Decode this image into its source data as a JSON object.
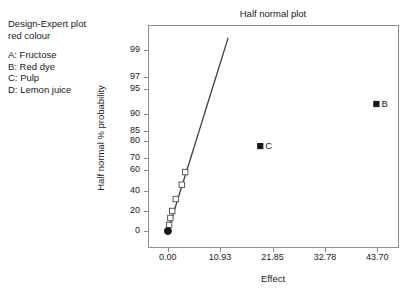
{
  "annotation": {
    "title_lines": [
      "Design-Expert plot",
      "red colour"
    ],
    "factors": [
      "A: Fructose",
      "B: Red dye",
      "C: Pulp",
      "D: Lemon juice"
    ]
  },
  "chart_data": {
    "type": "scatter",
    "title": "Half normal plot",
    "xlabel": "Effect",
    "ylabel": "Half normal % probability",
    "xlim": [
      -4.1,
      48.0
    ],
    "ylim": [
      0,
      99
    ],
    "grid": false,
    "legend": "none",
    "xticks": [
      "0.00",
      "10.93",
      "21.85",
      "32.78",
      "43.70"
    ],
    "xtick_values": [
      0.0,
      10.93,
      21.85,
      32.78,
      43.7
    ],
    "yticks": [
      "99",
      "97",
      "95",
      "90",
      "85",
      "80",
      "70",
      "60",
      "40",
      "20",
      "0"
    ],
    "ytick_values": [
      99,
      97,
      95,
      90,
      85,
      80,
      70,
      60,
      40,
      20,
      0
    ],
    "series": [
      {
        "name": "unlabelled effects",
        "marker": "open-square",
        "points": [
          {
            "x": 0.3,
            "y": 6
          },
          {
            "x": 0.55,
            "y": 13
          },
          {
            "x": 0.95,
            "y": 20
          },
          {
            "x": 1.7,
            "y": 32
          },
          {
            "x": 2.95,
            "y": 46
          },
          {
            "x": 3.65,
            "y": 58
          }
        ]
      },
      {
        "name": "origin point",
        "marker": "filled-circle",
        "points": [
          {
            "x": 0.05,
            "y": 0
          }
        ]
      },
      {
        "name": "significant effects",
        "marker": "filled-square",
        "points": [
          {
            "x": 19.3,
            "y": 77,
            "label": "C"
          },
          {
            "x": 43.5,
            "y": 92,
            "label": "B"
          }
        ]
      }
    ],
    "reference_line": {
      "name": "normal reference line",
      "x_start": 0.05,
      "y_start": 0,
      "x_end": 12.6,
      "y_end": 99.9
    }
  }
}
